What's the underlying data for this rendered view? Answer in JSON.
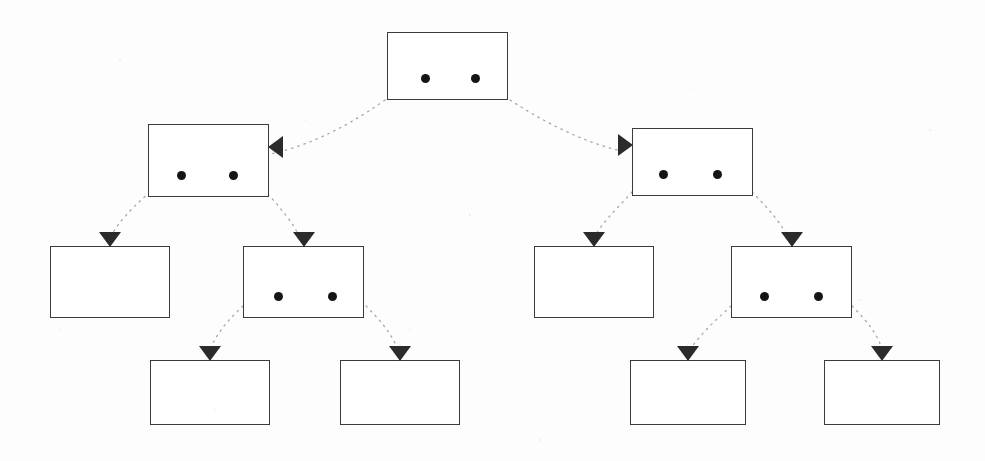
{
  "diagram": {
    "canvas": {
      "width": 985,
      "height": 461
    },
    "style": {
      "background_color": "#fdfdfd",
      "box_border_color": "#3b3b3b",
      "box_fill_color": "#ffffff",
      "dot_color": "#151515",
      "arrow_color": "#2b2b2b",
      "connector_color": "#8a8a8a",
      "connector_style": "dotted-curve"
    },
    "levels": [
      {
        "index": 0,
        "label": "root-level",
        "node_count": 1
      },
      {
        "index": 1,
        "label": "level-1",
        "node_count": 2
      },
      {
        "index": 2,
        "label": "level-2",
        "node_count": 4
      },
      {
        "index": 3,
        "label": "level-3",
        "node_count": 4
      }
    ],
    "nodes": [
      {
        "id": "root",
        "level": 0,
        "x": 387,
        "y": 32,
        "width": 121,
        "height": 68,
        "dots": 2,
        "dot_offsets": [
          33,
          83
        ],
        "arrow": "none",
        "label": ""
      },
      {
        "id": "n1-left",
        "level": 1,
        "x": 148,
        "y": 124,
        "width": 121,
        "height": 73,
        "dots": 2,
        "dot_offsets": [
          28,
          80
        ],
        "arrow": "left",
        "arrow_side": "right-edge",
        "label": ""
      },
      {
        "id": "n1-right",
        "level": 1,
        "x": 632,
        "y": 128,
        "width": 121,
        "height": 68,
        "dots": 2,
        "dot_offsets": [
          26,
          80
        ],
        "arrow": "right",
        "arrow_side": "left-edge",
        "label": ""
      },
      {
        "id": "n2-a",
        "level": 2,
        "x": 50,
        "y": 246,
        "width": 120,
        "height": 72,
        "dots": 0,
        "dot_offsets": [],
        "arrow": "down",
        "arrow_side": "top-edge",
        "label": ""
      },
      {
        "id": "n2-b",
        "level": 2,
        "x": 243,
        "y": 246,
        "width": 121,
        "height": 72,
        "dots": 2,
        "dot_offsets": [
          30,
          84
        ],
        "arrow": "down",
        "arrow_side": "top-edge",
        "label": ""
      },
      {
        "id": "n2-c",
        "level": 2,
        "x": 534,
        "y": 246,
        "width": 120,
        "height": 72,
        "dots": 0,
        "dot_offsets": [],
        "arrow": "down",
        "arrow_side": "top-edge",
        "label": ""
      },
      {
        "id": "n2-d",
        "level": 2,
        "x": 731,
        "y": 246,
        "width": 121,
        "height": 72,
        "dots": 2,
        "dot_offsets": [
          28,
          82
        ],
        "arrow": "down",
        "arrow_side": "top-edge",
        "label": ""
      },
      {
        "id": "n3-a",
        "level": 3,
        "x": 150,
        "y": 360,
        "width": 120,
        "height": 65,
        "dots": 0,
        "dot_offsets": [],
        "arrow": "down",
        "arrow_side": "top-edge",
        "label": ""
      },
      {
        "id": "n3-b",
        "level": 3,
        "x": 340,
        "y": 360,
        "width": 120,
        "height": 65,
        "dots": 0,
        "dot_offsets": [],
        "arrow": "down",
        "arrow_side": "top-edge",
        "label": ""
      },
      {
        "id": "n3-c",
        "level": 3,
        "x": 630,
        "y": 360,
        "width": 116,
        "height": 65,
        "dots": 0,
        "dot_offsets": [],
        "arrow": "down",
        "arrow_side": "top-edge",
        "label": ""
      },
      {
        "id": "n3-d",
        "level": 3,
        "x": 824,
        "y": 360,
        "width": 116,
        "height": 65,
        "dots": 0,
        "dot_offsets": [],
        "arrow": "down",
        "arrow_side": "top-edge",
        "label": ""
      }
    ],
    "edges": [
      {
        "id": "e-root-left",
        "from": "root",
        "to": "n1-left",
        "path": "M 385 100 C 340 132 300 148 270 154"
      },
      {
        "id": "e-root-right",
        "from": "root",
        "to": "n1-right",
        "path": "M 510 100 C 556 130 596 146 626 152"
      },
      {
        "id": "e-l1l-a",
        "from": "n1-left",
        "to": "n2-a",
        "path": "M 150 192 C 132 208 118 222 110 238"
      },
      {
        "id": "e-l1l-b",
        "from": "n1-left",
        "to": "n2-b",
        "path": "M 268 194 C 282 210 294 224 300 238"
      },
      {
        "id": "e-l1r-c",
        "from": "n1-right",
        "to": "n2-c",
        "path": "M 632 192 C 618 208 602 222 594 238"
      },
      {
        "id": "e-l1r-d",
        "from": "n1-right",
        "to": "n2-d",
        "path": "M 752 192 C 768 208 782 224 788 238"
      },
      {
        "id": "e-l2b-a",
        "from": "n2-b",
        "to": "n3-a",
        "path": "M 243 306 C 228 320 216 334 210 350"
      },
      {
        "id": "e-l2b-b",
        "from": "n2-b",
        "to": "n3-b",
        "path": "M 366 306 C 380 320 392 334 398 350"
      },
      {
        "id": "e-l2d-c",
        "from": "n2-d",
        "to": "n3-c",
        "path": "M 731 306 C 716 320 700 334 690 350"
      },
      {
        "id": "e-l2d-d",
        "from": "n2-d",
        "to": "n3-d",
        "path": "M 852 306 C 866 320 878 334 882 350"
      }
    ]
  }
}
